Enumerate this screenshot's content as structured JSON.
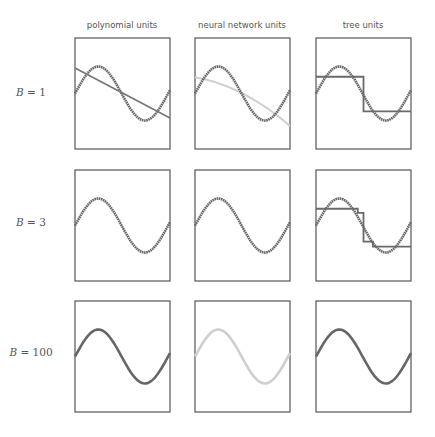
{
  "figure": {
    "column_titles": [
      "polynomial units",
      "neural network units",
      "tree units"
    ],
    "row_labels": [
      {
        "var": "B",
        "eq": "= 1"
      },
      {
        "var": "B",
        "eq": "= 3"
      },
      {
        "var": "B",
        "eq": "= 100"
      }
    ],
    "colors": {
      "frame": "#555555",
      "target_sine": "#666666",
      "polynomial_fit": "#777777",
      "neural_fit_light": "#cfcfcf",
      "tree_fit": "#6a6a6a"
    }
  },
  "chart_data": [
    {
      "type": "line",
      "title": "Small-multiples grid: ensemble fit of sin curve with B base units",
      "columns": [
        "polynomial units",
        "neural network units",
        "tree units"
      ],
      "rows": [
        "B = 1",
        "B = 3",
        "B = 100"
      ],
      "target": {
        "name": "sine wave",
        "function": "sin(2*pi*x)",
        "x_range": [
          0,
          1.05
        ]
      },
      "panels": [
        {
          "row": "B = 1",
          "col": "polynomial units",
          "fit": "straight decreasing line from upper-left (~0.7) to lower-right (~-0.9)"
        },
        {
          "row": "B = 1",
          "col": "neural network units",
          "fit": "smooth concave-down decreasing curve (light gray) from ~0.6 to ~-1.2"
        },
        {
          "row": "B = 1",
          "col": "tree units",
          "fit": "single-split step function: ~0.6 for x<0.5, ~-0.7 for x>=0.5"
        },
        {
          "row": "B = 3",
          "col": "polynomial units",
          "fit": "close to sine"
        },
        {
          "row": "B = 3",
          "col": "neural network units",
          "fit": "close to sine (light gray)"
        },
        {
          "row": "B = 3",
          "col": "tree units",
          "fit": "multi-step function: ~0.6, ~0.45, ~-0.6, ~-0.8"
        },
        {
          "row": "B = 100",
          "col": "polynomial units",
          "fit": "matches sine"
        },
        {
          "row": "B = 100",
          "col": "neural network units",
          "fit": "matches sine (light gray)"
        },
        {
          "row": "B = 100",
          "col": "tree units",
          "fit": "matches sine"
        }
      ],
      "grid": false,
      "axes_ticks": false
    }
  ]
}
